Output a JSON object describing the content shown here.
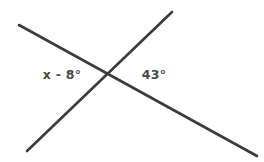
{
  "figure": {
    "type": "intersecting-lines-angle-diagram",
    "background_color": "#ffffff",
    "line_color": "#3c3c3c",
    "line_width": 2.6,
    "text_color": "#4a4a4a",
    "canvas": {
      "width": 264,
      "height": 162
    },
    "intersection_point": {
      "x": 108,
      "y": 76
    },
    "lines": [
      {
        "name": "line-falling",
        "description": "line from upper-left to lower-right",
        "x1": 19,
        "y1": 25,
        "x2": 257,
        "y2": 156
      },
      {
        "name": "line-rising",
        "description": "line from lower-left to upper-right",
        "x1": 27,
        "y1": 151,
        "x2": 172,
        "y2": 12
      }
    ],
    "labels": [
      {
        "name": "left-angle-label",
        "text": "x - 8°",
        "x": 62,
        "y": 75
      },
      {
        "name": "right-angle-label",
        "text": "43°",
        "x": 154,
        "y": 75
      }
    ]
  }
}
